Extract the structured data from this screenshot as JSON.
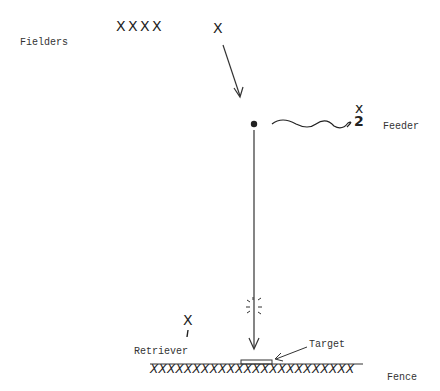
{
  "labels": {
    "fielders": "Fielders",
    "feeder": "Feeder",
    "retriever": "Retriever",
    "target": "Target",
    "fence": "Fence"
  },
  "marks": {
    "fielder_group": "X X X X",
    "fielder_single": "X",
    "feeder_x": "x",
    "feeder_number": "2",
    "retriever_x": "X",
    "retriever_number": "1",
    "fence_marks": "XXXXXXXXXXXXXXXXXXXXXXXX"
  },
  "colors": {
    "ink": "#222222",
    "text": "#333333",
    "background": "#ffffff"
  }
}
